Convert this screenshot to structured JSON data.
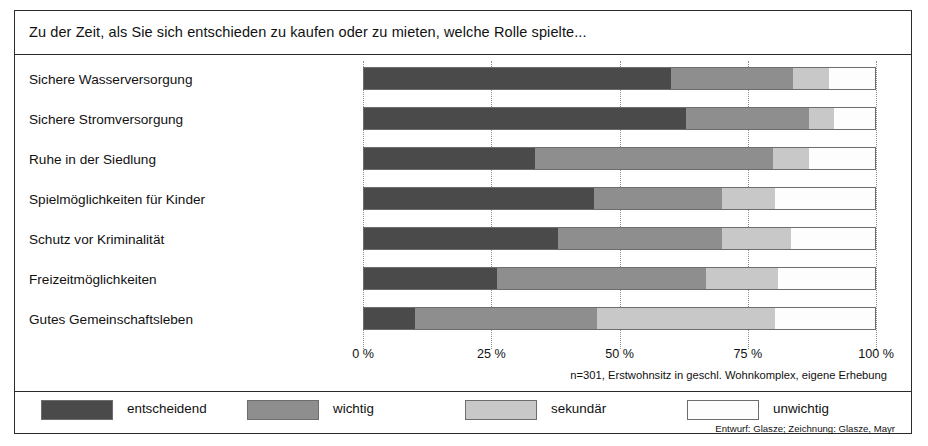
{
  "title": "Zu der Zeit, als Sie sich entschieden zu kaufen oder zu mieten, welche Rolle spielte...",
  "source_note": "n=301, Erstwohnsitz in geschl. Wohnkomplex, eigene Erhebung",
  "credit": "Entwurf: Glasze; Zeichnung: Glasze, Mayr",
  "axis": {
    "tick_labels": [
      "0 %",
      "25 %",
      "50 %",
      "75 %",
      "100 %"
    ]
  },
  "legend": {
    "items": [
      {
        "label": "entscheidend",
        "color": "#4a4a4a"
      },
      {
        "label": "wichtig",
        "color": "#8e8e8e"
      },
      {
        "label": "sekundär",
        "color": "#c8c8c8"
      },
      {
        "label": "unwichtig",
        "color": "#fdfdfd"
      }
    ]
  },
  "chart_data": {
    "type": "bar",
    "orientation": "horizontal",
    "stacked": true,
    "normalized_percent": true,
    "title": "Zu der Zeit, als Sie sich entschieden zu kaufen oder zu mieten, welche Rolle spielte...",
    "xlabel": "",
    "ylabel": "",
    "xlim": [
      0,
      100
    ],
    "xticks": [
      0,
      25,
      50,
      75,
      100
    ],
    "xtick_labels": [
      "0 %",
      "25 %",
      "50 %",
      "75 %",
      "100 %"
    ],
    "grid": "vertical-dotted",
    "legend_position": "bottom",
    "categories": [
      "Sichere Wasserversorgung",
      "Sichere Stromversorgung",
      "Ruhe in der Siedlung",
      "Spielmöglichkeiten für Kinder",
      "Schutz vor Kriminalität",
      "Freizeitmöglichkeiten",
      "Gutes Gemeinschaftsleben"
    ],
    "series": [
      {
        "name": "entscheidend",
        "color": "#4a4a4a",
        "values": [
          60,
          63,
          33.5,
          45,
          38,
          26,
          10
        ]
      },
      {
        "name": "wichtig",
        "color": "#8e8e8e",
        "values": [
          24,
          24,
          46.5,
          25,
          32,
          41,
          35.5
        ]
      },
      {
        "name": "sekundär",
        "color": "#c8c8c8",
        "values": [
          7,
          5,
          7,
          10.5,
          13.5,
          14,
          35
        ]
      },
      {
        "name": "unwichtig",
        "color": "#fdfdfd",
        "values": [
          9,
          8,
          13,
          19.5,
          16.5,
          19,
          19.5
        ]
      }
    ],
    "annotations": [
      "n=301, Erstwohnsitz in geschl. Wohnkomplex, eigene Erhebung",
      "Entwurf: Glasze; Zeichnung: Glasze, Mayr"
    ]
  }
}
